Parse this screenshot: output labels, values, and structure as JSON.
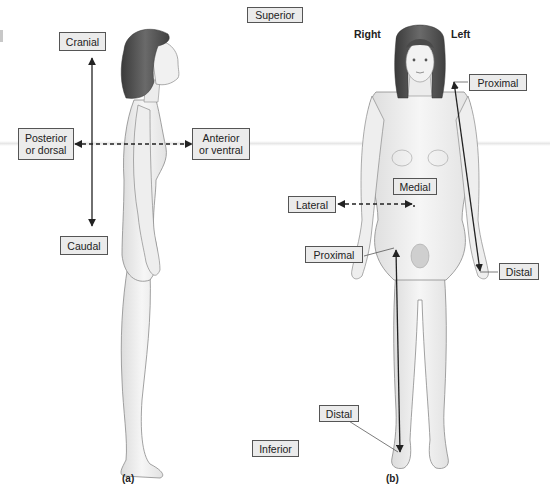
{
  "figure": {
    "panel_a": {
      "caption": "(a)",
      "view": "lateral",
      "labels": {
        "cranial": "Cranial",
        "caudal": "Caudal",
        "posterior": "Posterior\nor dorsal",
        "anterior": "Anterior\nor ventral"
      }
    },
    "center": {
      "superior": "Superior",
      "inferior": "Inferior"
    },
    "panel_b": {
      "caption": "(b)",
      "view": "anterior",
      "side_right": "Right",
      "side_left": "Left",
      "labels": {
        "arm_proximal": "Proximal",
        "arm_distal": "Distal",
        "medial": "Medial",
        "lateral": "Lateral",
        "leg_proximal": "Proximal",
        "leg_distal": "Distal"
      }
    },
    "colors": {
      "label_fill": "#ebebeb",
      "label_border": "#555555",
      "arrow": "#222222",
      "skin": "#f2f2f2",
      "skin_outline": "#8a8a8a",
      "hair": "#4a4a4a"
    }
  }
}
